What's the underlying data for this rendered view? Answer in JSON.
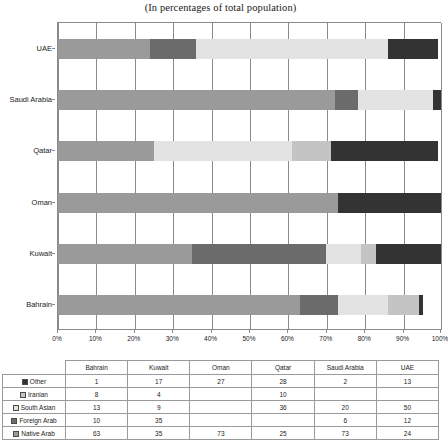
{
  "chart_data": {
    "type": "bar",
    "orientation": "horizontal",
    "stacked": true,
    "normalized": true,
    "title": "(In percentages of total population)",
    "xlabel": "",
    "ylabel": "",
    "xlim": [
      0,
      100
    ],
    "xticks": [
      "0%",
      "10%",
      "20%",
      "30%",
      "40%",
      "50%",
      "60%",
      "70%",
      "80%",
      "90%",
      "100%"
    ],
    "grid": "vertical",
    "legend_position": "table-row-headers",
    "categories": [
      "Bahrain",
      "Kuwait",
      "Oman",
      "Qatar",
      "Saudi Arabia",
      "UAE"
    ],
    "plot_order_top_to_bottom": [
      "UAE",
      "Saudi Arabia",
      "Qatar",
      "Oman",
      "Kuwait",
      "Bahrain"
    ],
    "series": [
      {
        "name": "Native Arab",
        "color": "#9a9a9a",
        "values": [
          63,
          35,
          73,
          25,
          73,
          24
        ]
      },
      {
        "name": "Foreign Arab",
        "color": "#6b6b6b",
        "values": [
          10,
          35,
          0,
          0,
          6,
          12
        ]
      },
      {
        "name": "South Asian",
        "color": "#e3e3e3",
        "values": [
          13,
          9,
          0,
          36,
          20,
          50
        ]
      },
      {
        "name": "Iranian",
        "color": "#c4c4c4",
        "values": [
          8,
          4,
          0,
          10,
          0,
          0
        ]
      },
      {
        "name": "Other",
        "color": "#333333",
        "values": [
          1,
          17,
          27,
          28,
          2,
          13
        ]
      }
    ],
    "stack_order_left_to_right": [
      "Native Arab",
      "Foreign Arab",
      "South Asian",
      "Iranian",
      "Other"
    ]
  },
  "table": {
    "corner_label": "",
    "column_headers": [
      "Bahrain",
      "Kuwait",
      "Oman",
      "Qatar",
      "Saudi Arabia",
      "UAE"
    ],
    "rows": [
      {
        "label": "Other",
        "swatch": "#333333",
        "values": [
          "1",
          "17",
          "27",
          "28",
          "2",
          "13"
        ]
      },
      {
        "label": "Iranian",
        "swatch": "#c4c4c4",
        "values": [
          "8",
          "4",
          "",
          "10",
          "",
          ""
        ]
      },
      {
        "label": "South Asian",
        "swatch": "#e3e3e3",
        "values": [
          "13",
          "9",
          "",
          "36",
          "20",
          "50"
        ]
      },
      {
        "label": "Foreign Arab",
        "swatch": "#6b6b6b",
        "values": [
          "10",
          "35",
          "",
          "",
          "6",
          "12"
        ]
      },
      {
        "label": "Native Arab",
        "swatch": "#9a9a9a",
        "values": [
          "63",
          "35",
          "73",
          "25",
          "73",
          "24"
        ]
      }
    ]
  }
}
